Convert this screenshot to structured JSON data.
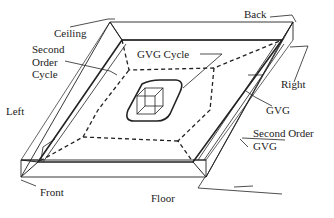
{
  "diagram": {
    "labels": {
      "ceiling": "Ceiling",
      "back": "Back",
      "second_order_cycle_1": "Second",
      "second_order_cycle_2": "Order",
      "second_order_cycle_3": "Cycle",
      "gvg_cycle": "GVG Cycle",
      "right": "Right",
      "left": "Left",
      "gvg": "GVG",
      "second_order_gvg_1": "Second Order",
      "second_order_gvg_2": "GVG",
      "front": "Front",
      "floor": "Floor"
    },
    "colors": {
      "stroke": "#222222",
      "background": "#ffffff"
    }
  }
}
